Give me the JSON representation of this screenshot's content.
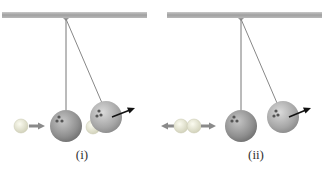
{
  "figure": {
    "panels": [
      {
        "id": "i",
        "label": "(i)",
        "description": "Small ball moving right toward hanging large ball; large ball swings right after collision, small ball near it"
      },
      {
        "id": "ii",
        "label": "(ii)",
        "description": "Small ball shown with arrows both left and right; large hanging ball swings right after collision"
      }
    ],
    "colors": {
      "bar": "#a8a8a8",
      "string": "#777777",
      "large_ball": "#9a9a9a",
      "small_ball": "#e6e6d0",
      "arrow_gray": "#8a8a8a",
      "arrow_black": "#111111"
    }
  }
}
